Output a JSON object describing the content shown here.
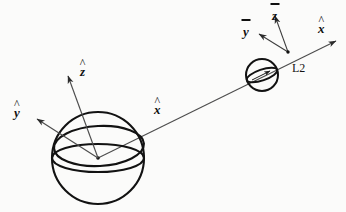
{
  "figure": {
    "domain": "Diagram",
    "background_color": "#fbfbfa",
    "ink_color": "#101010",
    "line_color": "#4a4a4a",
    "width": 346,
    "height": 212
  },
  "labels": {
    "earth_z": {
      "base": "z",
      "accent": "hat",
      "text": "ẑ"
    },
    "earth_y": {
      "base": "y",
      "accent": "hat",
      "text": "ŷ"
    },
    "earth_x": {
      "base": "x",
      "accent": "hat",
      "text": "x̂"
    },
    "l2_z": {
      "base": "z",
      "accent": "bar",
      "text": "z̄"
    },
    "l2_y": {
      "base": "y",
      "accent": "bar",
      "text": "ȳ"
    },
    "l2_x": {
      "base": "x",
      "accent": "hat",
      "text": "x̂"
    },
    "l2_point": {
      "text": "L2"
    }
  },
  "bodies": [
    {
      "name": "earth-sphere",
      "cx": 98,
      "cy": 158,
      "r": 46,
      "equator_ry": 14,
      "tilted_ellipse_ry": 20,
      "tilted_ellipse_rotation_deg": -4
    },
    {
      "name": "l2-sphere",
      "cx": 262,
      "cy": 75,
      "r": 16,
      "equator_ry": 5.5,
      "equator_rotation_deg": -19
    }
  ],
  "frames": [
    {
      "name": "earth-frame",
      "origin": {
        "x": 98,
        "y": 158
      },
      "axes": [
        {
          "name": "z-axis",
          "tip": {
            "x": 68,
            "y": 76
          },
          "label": "ẑ"
        },
        {
          "name": "y-axis",
          "tip": {
            "x": 37,
            "y": 119
          },
          "label": "ŷ"
        },
        {
          "name": "x-axis",
          "tip": {
            "x": 336,
            "y": 41
          },
          "label": "x̂"
        }
      ]
    },
    {
      "name": "l2-frame",
      "origin": {
        "x": 288,
        "y": 52
      },
      "axes": [
        {
          "name": "z-bar-axis",
          "tip": {
            "x": 275,
            "y": 16
          },
          "label": "z̄"
        },
        {
          "name": "y-bar-axis",
          "tip": {
            "x": 259,
            "y": 34
          },
          "label": "ȳ"
        },
        {
          "name": "x-bar-axis",
          "tip": {
            "x": 336,
            "y": 41
          },
          "label": "x̂"
        }
      ]
    }
  ],
  "label_positions": {
    "earth_z": {
      "x": 80,
      "y": 65
    },
    "earth_y": {
      "x": 14,
      "y": 106
    },
    "earth_x": {
      "x": 154,
      "y": 103
    },
    "l2_z": {
      "x": 272,
      "y": 8
    },
    "l2_y": {
      "x": 243,
      "y": 25
    },
    "l2_x": {
      "x": 318,
      "y": 22
    },
    "l2_point": {
      "x": 292,
      "y": 62
    }
  }
}
